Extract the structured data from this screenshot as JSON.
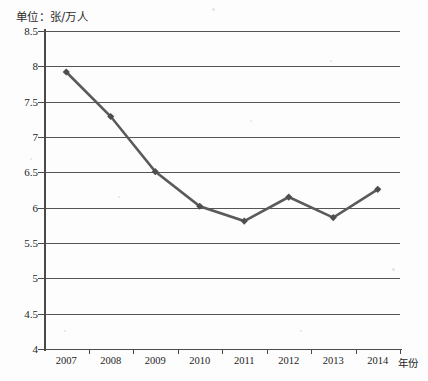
{
  "caption": {
    "unit_label": "单位：张/万人"
  },
  "axis": {
    "x_title": "年份",
    "y_ticks": [
      "8.5",
      "8",
      "7.5",
      "7",
      "6.5",
      "6",
      "5.5",
      "5",
      "4.5",
      "4"
    ],
    "x_ticks": [
      "2007",
      "2008",
      "2009",
      "2010",
      "2011",
      "2012",
      "2013",
      "2014"
    ]
  },
  "style": {
    "line_color": "#5a5a5a",
    "marker_color": "#4e4e4e",
    "grid_color": "#555555",
    "axis_color": "#4a4a4a",
    "background": "#fdfdfd"
  },
  "chart_data": {
    "type": "line",
    "title": "单位：张/万人",
    "xlabel": "年份",
    "ylabel": "张/万人",
    "categories": [
      "2007",
      "2008",
      "2009",
      "2010",
      "2011",
      "2012",
      "2013",
      "2014"
    ],
    "values": [
      7.92,
      7.29,
      6.51,
      6.02,
      5.81,
      6.15,
      5.86,
      6.26
    ],
    "series": [
      {
        "name": "张/万人",
        "values": [
          7.92,
          7.29,
          6.51,
          6.02,
          5.81,
          6.15,
          5.86,
          6.26
        ]
      }
    ],
    "ylim": [
      4,
      8.5
    ],
    "y_tick_values": [
      4,
      4.5,
      5,
      5.5,
      6,
      6.5,
      7,
      7.5,
      8,
      8.5
    ],
    "grid": true,
    "grid_axis": "y",
    "legend": false,
    "markers": "diamond"
  }
}
